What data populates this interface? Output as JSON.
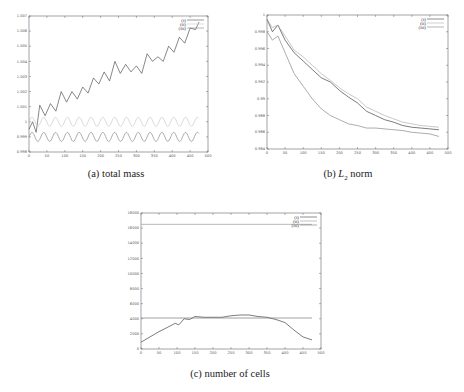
{
  "chart_data": [
    {
      "id": "a",
      "type": "line",
      "caption": "(a) total mass",
      "xlabel": "",
      "ylabel": "",
      "xlim": [
        0,
        500
      ],
      "ylim": [
        0.998,
        1.007
      ],
      "xticks": [
        0,
        50,
        100,
        150,
        200,
        250,
        300,
        350,
        400,
        450,
        500
      ],
      "yticks": [
        "0.998",
        "0.999",
        "1",
        "1.001",
        "1.002",
        "1.003",
        "1.004",
        "1.005",
        "1.006",
        "1.007"
      ],
      "grid": false,
      "legend_position": "top-right",
      "series": [
        {
          "name": "(i)",
          "color": "#555555",
          "description": "increasing oscillating",
          "x": [
            0,
            10,
            20,
            30,
            45,
            60,
            75,
            90,
            105,
            120,
            135,
            150,
            165,
            180,
            195,
            210,
            225,
            240,
            255,
            270,
            285,
            300,
            315,
            330,
            345,
            360,
            375,
            390,
            405,
            420,
            435,
            450,
            465,
            475
          ],
          "y": [
            0.9995,
            1.0,
            0.9993,
            1.0011,
            1.0004,
            1.0012,
            1.0007,
            1.002,
            1.0013,
            1.002,
            1.0015,
            1.0023,
            1.0019,
            1.0029,
            1.0025,
            1.0033,
            1.0027,
            1.004,
            1.0032,
            1.0038,
            1.0033,
            1.0037,
            1.0032,
            1.0045,
            1.004,
            1.0043,
            1.004,
            1.005,
            1.0046,
            1.0056,
            1.0052,
            1.0062,
            1.0061,
            1.0066
          ]
        },
        {
          "name": "(ii)",
          "color": "#c8c8c8",
          "description": "oscillating around 1.0",
          "x": [
            0,
            475
          ],
          "y_center": 1.0,
          "amplitude": 0.0003,
          "period": 33
        },
        {
          "name": "(iii)",
          "color": "#888888",
          "description": "oscillating around 0.999",
          "x": [
            0,
            475
          ],
          "y_center": 0.999,
          "amplitude": 0.0003,
          "period": 33
        }
      ]
    },
    {
      "id": "b",
      "type": "line",
      "caption_prefix": "(b) ",
      "caption_math": "L",
      "caption_sub": "2",
      "caption_suffix": " norm",
      "xlabel": "",
      "ylabel": "",
      "xlim": [
        0,
        500
      ],
      "ylim": [
        0.984,
        1.0
      ],
      "xticks": [
        0,
        50,
        100,
        150,
        200,
        250,
        300,
        350,
        400,
        450,
        500
      ],
      "yticks": [
        "0.984",
        "0.986",
        "0.988",
        "0.99",
        "0.992",
        "0.994",
        "0.996",
        "0.998",
        "1"
      ],
      "grid": false,
      "legend_position": "top-right",
      "series": [
        {
          "name": "(i)",
          "color": "#444444",
          "x": [
            0,
            15,
            30,
            50,
            75,
            100,
            125,
            150,
            175,
            200,
            225,
            250,
            275,
            300,
            325,
            350,
            375,
            400,
            425,
            450,
            475
          ],
          "y": [
            0.9995,
            0.998,
            0.9988,
            0.997,
            0.9955,
            0.9945,
            0.9935,
            0.9925,
            0.992,
            0.991,
            0.9902,
            0.9895,
            0.9885,
            0.988,
            0.9875,
            0.9872,
            0.9868,
            0.9866,
            0.9865,
            0.9864,
            0.9863
          ]
        },
        {
          "name": "(ii)",
          "color": "#b0b0b0",
          "x": [
            0,
            15,
            30,
            50,
            75,
            100,
            125,
            150,
            175,
            200,
            225,
            250,
            275,
            300,
            325,
            350,
            375,
            400,
            425,
            450,
            475
          ],
          "y": [
            0.9995,
            0.9985,
            0.9988,
            0.9975,
            0.9958,
            0.995,
            0.994,
            0.993,
            0.9922,
            0.9913,
            0.9906,
            0.99,
            0.989,
            0.9885,
            0.988,
            0.9876,
            0.9872,
            0.987,
            0.9868,
            0.9867,
            0.9866
          ]
        },
        {
          "name": "(iii)",
          "color": "#888888",
          "x": [
            0,
            15,
            30,
            50,
            75,
            100,
            125,
            150,
            175,
            200,
            225,
            250,
            275,
            300,
            325,
            350,
            375,
            400,
            425,
            450,
            475
          ],
          "y": [
            0.998,
            0.997,
            0.9975,
            0.9955,
            0.993,
            0.9915,
            0.99,
            0.9888,
            0.988,
            0.9875,
            0.987,
            0.9868,
            0.9865,
            0.9865,
            0.9864,
            0.9863,
            0.9862,
            0.986,
            0.9859,
            0.9858,
            0.9855
          ]
        }
      ]
    },
    {
      "id": "c",
      "type": "line",
      "caption": "(c) number of cells",
      "xlabel": "",
      "ylabel": "",
      "xlim": [
        0,
        500
      ],
      "ylim": [
        0,
        18000
      ],
      "xticks": [
        0,
        50,
        100,
        150,
        200,
        250,
        300,
        350,
        400,
        450,
        500
      ],
      "yticks": [
        "0",
        "2000",
        "4000",
        "6000",
        "8000",
        "10000",
        "12000",
        "14000",
        "16000",
        "18000"
      ],
      "grid": false,
      "legend_position": "top-right",
      "series": [
        {
          "name": "(i)",
          "color": "#444444",
          "x": [
            0,
            25,
            50,
            75,
            95,
            105,
            120,
            135,
            150,
            175,
            200,
            225,
            250,
            275,
            300,
            325,
            350,
            375,
            400,
            425,
            450,
            475
          ],
          "y": [
            900,
            1600,
            2300,
            2900,
            3400,
            3200,
            4000,
            3900,
            4300,
            4200,
            4200,
            4200,
            4400,
            4500,
            4500,
            4300,
            4200,
            3900,
            3500,
            2500,
            1600,
            1200
          ]
        },
        {
          "name": "(ii)",
          "color": "#999999",
          "x": [
            0,
            475
          ],
          "y": [
            16500,
            16500
          ]
        },
        {
          "name": "(iii)",
          "color": "#777777",
          "x": [
            0,
            475
          ],
          "y": [
            4100,
            4100
          ]
        }
      ]
    }
  ]
}
